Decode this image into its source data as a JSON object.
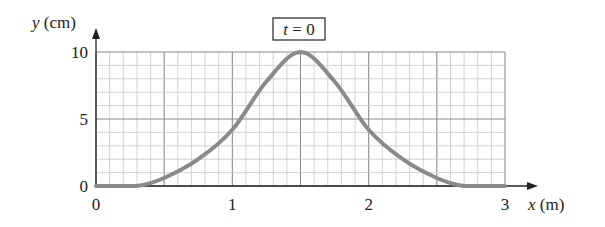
{
  "chart_data": {
    "type": "line",
    "title": "t = 0",
    "xlabel": "x (m)",
    "ylabel": "y (cm)",
    "xlabel_var": "x",
    "xlabel_unit": "(m)",
    "ylabel_var": "y",
    "ylabel_unit": "(cm)",
    "xlim": [
      0,
      3
    ],
    "ylim": [
      0,
      10
    ],
    "x_ticks": [
      "0",
      "1",
      "2",
      "3"
    ],
    "y_ticks": [
      "0",
      "5",
      "10"
    ],
    "grid": true,
    "grid_minor_x": 0.1,
    "grid_minor_y": 1,
    "grid_major_x": 0.5,
    "grid_major_y": 5,
    "series": [
      {
        "name": "pulse at t = 0",
        "x": [
          0,
          0.3,
          0.5,
          0.75,
          1.0,
          1.25,
          1.5,
          1.75,
          2.0,
          2.25,
          2.5,
          2.7,
          3.0
        ],
        "y": [
          0,
          0,
          0.6,
          2.0,
          4.2,
          7.8,
          10,
          7.8,
          4.2,
          2.0,
          0.6,
          0,
          0
        ]
      }
    ]
  },
  "labels": {
    "time_box": "t = 0",
    "time_var": "t",
    "time_eq": " = 0"
  },
  "colors": {
    "curve": "#8a8a8a",
    "grid_minor": "#c8c8c8",
    "grid_major": "#8c8c8c",
    "axis": "#222222"
  }
}
